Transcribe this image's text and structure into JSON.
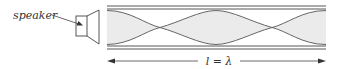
{
  "labels": {
    "speaker": "speaker",
    "length": "l = λ"
  },
  "colors": {
    "line": "#444444",
    "fill": "#ebebeb",
    "background": "#ffffff"
  },
  "diagram": {
    "tube": {
      "x_start": 107,
      "x_end": 326
    },
    "crossings_x": [
      160,
      272
    ]
  }
}
